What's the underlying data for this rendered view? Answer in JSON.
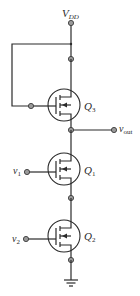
{
  "diagram": {
    "type": "circuit-schematic",
    "supply": {
      "label": "V",
      "subscript": "DD"
    },
    "output": {
      "label": "v",
      "subscript": "out"
    },
    "transistors": [
      {
        "id": "Q3",
        "label": "Q",
        "subscript": "3",
        "role": "diode-connected load"
      },
      {
        "id": "Q1",
        "label": "Q",
        "subscript": "1",
        "gate_input": {
          "label": "v",
          "subscript": "1"
        }
      },
      {
        "id": "Q2",
        "label": "Q",
        "subscript": "2",
        "gate_input": {
          "label": "v",
          "subscript": "2"
        }
      }
    ],
    "ground": "ground-symbol",
    "colors": {
      "wire": "#2a2a2a",
      "node_fill": "#9a9a9a"
    }
  }
}
